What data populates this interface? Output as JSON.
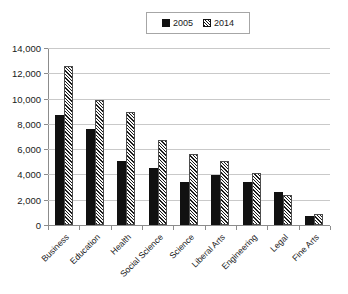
{
  "chart_data": {
    "type": "bar",
    "title": "",
    "xlabel": "",
    "ylabel": "",
    "categories": [
      "Business",
      "Education",
      "Health",
      "Social Science",
      "Science",
      "Liberal Arts",
      "Engineering",
      "Legal",
      "Fine Arts"
    ],
    "series": [
      {
        "name": "2005",
        "values": [
          8700,
          7600,
          5100,
          4500,
          3400,
          3950,
          3400,
          2600,
          720
        ]
      },
      {
        "name": "2014",
        "values": [
          12550,
          9850,
          8950,
          6750,
          5600,
          5050,
          4100,
          2400,
          900
        ]
      }
    ],
    "ylim": [
      0,
      14000
    ],
    "ytick_values": [
      0,
      2000,
      4000,
      6000,
      8000,
      10000,
      12000,
      14000
    ],
    "ytick_labels": [
      "0",
      "2,000",
      "4,000",
      "6,000",
      "8,000",
      "10,000",
      "12,000",
      "14,000"
    ],
    "grid": true,
    "legend_position": "top-center",
    "colors": {
      "series_2005": "#111111",
      "series_2014_hatch": "#1a1a1a",
      "series_2014_fill": "#f2f2f2",
      "gridline": "#c9c9c9",
      "axis": "#8c8c8c"
    }
  },
  "legend": {
    "entries": [
      {
        "label": "2005",
        "style": "solid"
      },
      {
        "label": "2014",
        "style": "hatch"
      }
    ]
  }
}
